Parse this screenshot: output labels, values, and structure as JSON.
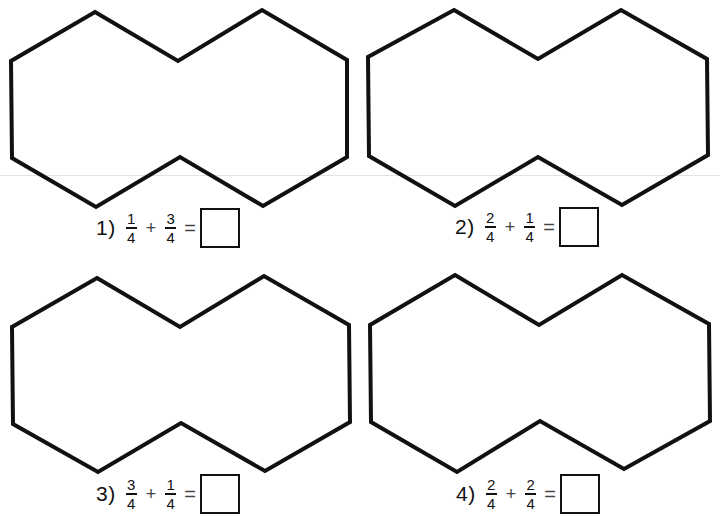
{
  "worksheet": {
    "shape_stroke": "#111111",
    "shapes": [
      {
        "points": "95,12 178,61 262,10 347,60 347,157 263,206 180,157 96,207 12,158 11,61"
      },
      {
        "points": "454,10 538,59 621,10 707,59 708,155 622,205 538,157 455,206 369,156 368,57"
      },
      {
        "points": "97,278 180,327 264,276 349,325 350,422 265,471 181,423 98,472 13,424 12,327"
      },
      {
        "points": "455,275 539,325 622,275 709,324 710,421 624,469 540,421 457,472 371,422 370,325"
      }
    ],
    "problems": [
      {
        "number": "1)",
        "a_num": "1",
        "a_den": "4",
        "op": "+",
        "b_num": "3",
        "b_den": "4",
        "eq": "=",
        "answer": ""
      },
      {
        "number": "2)",
        "a_num": "2",
        "a_den": "4",
        "op": "+",
        "b_num": "1",
        "b_den": "4",
        "eq": "=",
        "answer": ""
      },
      {
        "number": "3)",
        "a_num": "3",
        "a_den": "4",
        "op": "+",
        "b_num": "1",
        "b_den": "4",
        "eq": "=",
        "answer": ""
      },
      {
        "number": "4)",
        "a_num": "2",
        "a_den": "4",
        "op": "+",
        "b_num": "2",
        "b_den": "4",
        "eq": "=",
        "answer": ""
      }
    ]
  }
}
